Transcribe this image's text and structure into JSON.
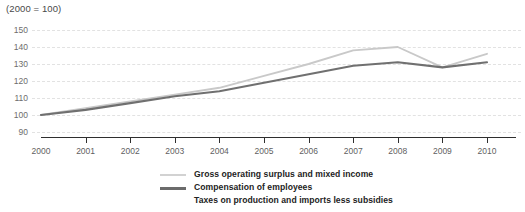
{
  "chart_data": {
    "type": "line",
    "title": "(2000 = 100)",
    "xlabel": "",
    "ylabel": "",
    "grid": true,
    "legend_position": "bottom",
    "x": [
      2000,
      2001,
      2002,
      2003,
      2004,
      2005,
      2006,
      2007,
      2008,
      2009,
      2010
    ],
    "categories": [
      "2000",
      "2001",
      "2002",
      "2003",
      "2004",
      "2005",
      "2006",
      "2007",
      "2008",
      "2009",
      "2010"
    ],
    "yticks": [
      90,
      100,
      110,
      120,
      130,
      140,
      150
    ],
    "ylim": [
      90,
      150
    ],
    "xlim": [
      2000,
      2010
    ],
    "series": [
      {
        "name": "Gross operating surplus and mixed income",
        "color": "#c9c9c9",
        "values": [
          100,
          104,
          108,
          112,
          116,
          123,
          130,
          138,
          140,
          128,
          136
        ]
      },
      {
        "name": "Compensation of employees",
        "color": "#707070",
        "values": [
          100,
          103,
          107,
          111,
          114,
          119,
          124,
          129,
          131,
          128,
          131
        ]
      },
      {
        "name": "Taxes on production and imports less subsidies",
        "color": "#ffffff",
        "values": [
          null,
          null,
          null,
          null,
          null,
          null,
          null,
          null,
          null,
          null,
          null
        ]
      }
    ]
  },
  "legend": {
    "items": [
      {
        "label": "Gross operating surplus and mixed income",
        "swatch": "thin"
      },
      {
        "label": "Compensation of employees",
        "swatch": "thick"
      },
      {
        "label": "Taxes on production and imports less subsidies",
        "swatch": "none"
      }
    ]
  },
  "colors": {
    "series_light": "#c9c9c9",
    "series_dark": "#707070",
    "gridline": "#e2e2e2",
    "axis": "#2f2f2f",
    "tick_text": "#5f5f5f",
    "legend_text": "#232323"
  }
}
